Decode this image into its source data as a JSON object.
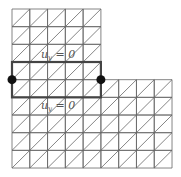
{
  "diagram": {
    "grid": {
      "origin_x": 12,
      "origin_y": 9,
      "cell_w": 17.78,
      "cell_h": 17.67,
      "columns": 9,
      "rows": 9,
      "upper_part": {
        "cols": 5,
        "rows": 4
      },
      "lower_part": {
        "cols": 9,
        "rows": 5
      },
      "diagonal": "bottom-left to top-right",
      "line_color": "#666666"
    },
    "strip": {
      "row_start": 3,
      "row_end": 5,
      "col_start": 0,
      "col_end": 5,
      "stroke_color": "#444444"
    },
    "nodes": [
      {
        "name": "left-node",
        "col": 0,
        "row": 4
      },
      {
        "name": "right-node",
        "col": 5,
        "row": 4
      }
    ],
    "labels": {
      "top": "u_y = 0",
      "top_text": "u",
      "top_sub": "y",
      "top_rest": " = 0",
      "bottom": "u_y = 0",
      "bottom_text": "u",
      "bottom_sub": "y",
      "bottom_rest": " = 0"
    }
  }
}
